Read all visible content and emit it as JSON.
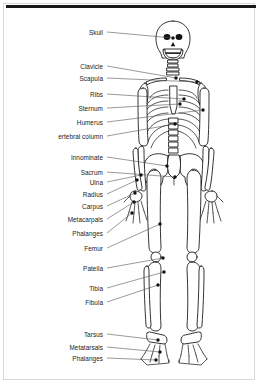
{
  "figure": {
    "view": "anterior",
    "label_count": 18,
    "line_color": "#555555",
    "bone_stroke_color": "#111111",
    "background_color": "#ffffff",
    "border_color": "#d8d8d8",
    "rule_color": "#1a1a1a"
  },
  "labels": [
    {
      "id": "skull",
      "text": "Skull",
      "label_x": 103,
      "label_y": 32,
      "end_x": 173,
      "end_y": 38
    },
    {
      "id": "clavicle",
      "text": "Clavicle",
      "label_x": 103,
      "label_y": 66,
      "end_x": 176,
      "end_y": 78
    },
    {
      "id": "scapula",
      "text": "Scapula",
      "label_x": 103,
      "label_y": 78,
      "end_x": 197,
      "end_y": 82
    },
    {
      "id": "ribs",
      "text": "Ribs",
      "label_x": 103,
      "label_y": 94,
      "end_x": 184,
      "end_y": 99
    },
    {
      "id": "sternum",
      "text": "Sternum",
      "label_x": 103,
      "label_y": 108,
      "end_x": 180,
      "end_y": 104
    },
    {
      "id": "humerus",
      "text": "Humerus",
      "label_x": 103,
      "label_y": 122,
      "end_x": 203,
      "end_y": 110
    },
    {
      "id": "vertebral-column",
      "text": "ertebral column",
      "label_x": 103,
      "label_y": 136,
      "end_x": 175,
      "end_y": 124
    },
    {
      "id": "innominate",
      "text": "Innominate",
      "label_x": 103,
      "label_y": 157,
      "end_x": 167,
      "end_y": 166
    },
    {
      "id": "sacrum",
      "text": "Sacrum",
      "label_x": 103,
      "label_y": 172,
      "end_x": 175,
      "end_y": 177
    },
    {
      "id": "ulna",
      "text": "Ulna",
      "label_x": 103,
      "label_y": 182,
      "end_x": 141,
      "end_y": 175
    },
    {
      "id": "radius",
      "text": "Radius",
      "label_x": 103,
      "label_y": 194,
      "end_x": 137,
      "end_y": 180
    },
    {
      "id": "carpus",
      "text": "Carpus",
      "label_x": 103,
      "label_y": 206,
      "end_x": 135,
      "end_y": 193
    },
    {
      "id": "metacarpals",
      "text": "Metacarpals",
      "label_x": 103,
      "label_y": 219,
      "end_x": 134,
      "end_y": 202
    },
    {
      "id": "phalanges-hand",
      "text": "Phalanges",
      "label_x": 103,
      "label_y": 233,
      "end_x": 132,
      "end_y": 213
    },
    {
      "id": "femur",
      "text": "Femur",
      "label_x": 103,
      "label_y": 248,
      "end_x": 160,
      "end_y": 224
    },
    {
      "id": "patella",
      "text": "Patella",
      "label_x": 103,
      "label_y": 268,
      "end_x": 163,
      "end_y": 258
    },
    {
      "id": "tibia",
      "text": "Tibia",
      "label_x": 103,
      "label_y": 288,
      "end_x": 164,
      "end_y": 272
    },
    {
      "id": "fibula",
      "text": "Fibula",
      "label_x": 103,
      "label_y": 302,
      "end_x": 158,
      "end_y": 285
    },
    {
      "id": "tarsus",
      "text": "Tarsus",
      "label_x": 103,
      "label_y": 334,
      "end_x": 158,
      "end_y": 340
    },
    {
      "id": "metatarsals",
      "text": "Metatarsals",
      "label_x": 103,
      "label_y": 347,
      "end_x": 160,
      "end_y": 352
    },
    {
      "id": "phalanges-foot",
      "text": "Phalanges",
      "label_x": 103,
      "label_y": 358,
      "end_x": 156,
      "end_y": 360
    }
  ]
}
